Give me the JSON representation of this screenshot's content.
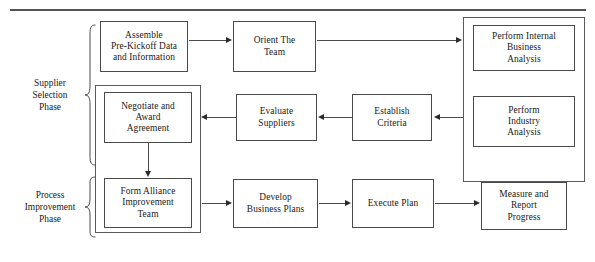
{
  "figure": {
    "type": "flowchart",
    "top_rule_present": true
  },
  "phases": [
    {
      "id": "supplier-selection",
      "label": "Supplier\nSelection\nPhase"
    },
    {
      "id": "process-improvement",
      "label": "Process\nImprovement\nPhase"
    }
  ],
  "nodes": [
    {
      "id": "assemble",
      "label": "Assemble\nPre-Kickoff Data\nand Information",
      "row": "top",
      "column": 1
    },
    {
      "id": "orient",
      "label": "Orient The\nTeam",
      "row": "top",
      "column": 2
    },
    {
      "id": "perform-internal",
      "label": "Perform Internal\nBusiness\nAnalysis",
      "row": "top",
      "column": 4
    },
    {
      "id": "perform-industry",
      "label": "Perform\nIndustry\nAnalysis",
      "row": "middle",
      "column": 4
    },
    {
      "id": "negotiate",
      "label": "Negotiate and\nAward\nAgreement",
      "row": "middle",
      "column": 1
    },
    {
      "id": "evaluate",
      "label": "Evaluate\nSuppliers",
      "row": "middle",
      "column": 2
    },
    {
      "id": "establish",
      "label": "Establish\nCriteria",
      "row": "middle",
      "column": 3
    },
    {
      "id": "form-alliance",
      "label": "Form Alliance\nImprovement\nTeam",
      "row": "bottom",
      "column": 1
    },
    {
      "id": "develop",
      "label": "Develop\nBusiness Plans",
      "row": "bottom",
      "column": 2
    },
    {
      "id": "execute",
      "label": "Execute Plan",
      "row": "bottom",
      "column": 3
    },
    {
      "id": "measure",
      "label": "Measure and\nReport\nProgress",
      "row": "bottom",
      "column": 4
    }
  ],
  "groups": [
    {
      "id": "analysis-group",
      "contains": [
        "perform-internal",
        "perform-industry"
      ]
    },
    {
      "id": "alliance-group",
      "contains": [
        "negotiate",
        "form-alliance"
      ]
    }
  ],
  "edges": [
    {
      "from": "assemble",
      "to": "orient",
      "direction": "right"
    },
    {
      "from": "orient",
      "to": "analysis-group",
      "direction": "right"
    },
    {
      "from": "analysis-group",
      "to": "establish",
      "direction": "left"
    },
    {
      "from": "establish",
      "to": "evaluate",
      "direction": "left"
    },
    {
      "from": "evaluate",
      "to": "negotiate",
      "direction": "left"
    },
    {
      "from": "negotiate",
      "to": "form-alliance",
      "direction": "down"
    },
    {
      "from": "alliance-group",
      "to": "develop",
      "direction": "right"
    },
    {
      "from": "develop",
      "to": "execute",
      "direction": "right"
    },
    {
      "from": "execute",
      "to": "measure",
      "direction": "right"
    }
  ],
  "colors": {
    "box_border": "#4a4a4a",
    "group_border": "#5a5a5a",
    "line": "#4a4a4a",
    "arrowhead": "#2b2b2b",
    "text": "#1a1a1a",
    "rule": "#555555",
    "background": "#ffffff"
  }
}
